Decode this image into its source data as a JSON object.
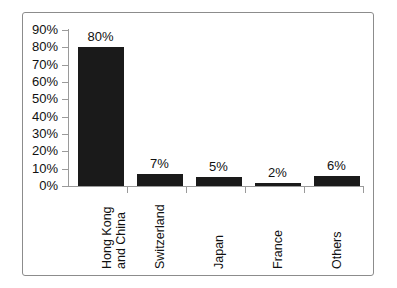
{
  "chart_data": {
    "type": "bar",
    "title": "",
    "subtitle": "",
    "xlabel": "",
    "ylabel": "",
    "categories": [
      "Hong Kong and China",
      "Switzerland",
      "Japan",
      "France",
      "Others"
    ],
    "category_lines": [
      [
        "Hong Kong",
        "and China"
      ],
      [
        "Switzerland"
      ],
      [
        "Japan"
      ],
      [
        "France"
      ],
      [
        "Others"
      ]
    ],
    "values": [
      80,
      7,
      5,
      2,
      6
    ],
    "value_labels": [
      "80%",
      "7%",
      "5%",
      "2%",
      "6%"
    ],
    "ylim": [
      0,
      90
    ],
    "ytick_values": [
      0,
      10,
      20,
      30,
      40,
      50,
      60,
      70,
      80,
      90
    ],
    "ytick_labels": [
      "0%",
      "10%",
      "20%",
      "30%",
      "40%",
      "50%",
      "60%",
      "70%",
      "80%",
      "90%"
    ],
    "grid": false,
    "legend": false,
    "legend_position": "none",
    "bar_color": "#1a1a1a",
    "axis_color": "#9a9a9a",
    "frame_color": "#8c8c8c",
    "background_color": "#ffffff",
    "text_color": "#111111"
  }
}
